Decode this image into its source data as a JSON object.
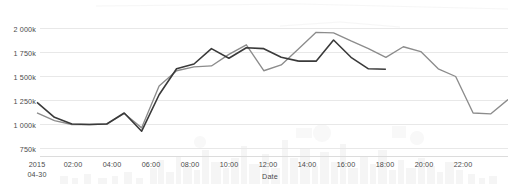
{
  "chart_data": {
    "type": "line",
    "title": "",
    "xlabel": "Date",
    "ylabel": "",
    "ylim": [
      750000,
      2060000
    ],
    "grid": true,
    "legend": "none",
    "y_tick_labels": [
      "2 000k",
      "1 750k",
      "1 500k",
      "1 250k",
      "1 000k",
      "750k"
    ],
    "y_tick_values": [
      2000000,
      1750000,
      1500000,
      1250000,
      1000000,
      750000
    ],
    "x_tick_labels": [
      "2015\n04-30",
      "02:00",
      "04:00",
      "06:00",
      "08:00",
      "10:00",
      "12:00",
      "14:00",
      "16:00",
      "18:00",
      "20:00",
      "22:00"
    ],
    "x_tick_first_line": "2015",
    "x_tick_first_line2": "04-30",
    "x_tick_hours": [
      "02:00",
      "04:00",
      "06:00",
      "08:00",
      "10:00",
      "12:00",
      "14:00",
      "16:00",
      "18:00",
      "20:00",
      "22:00"
    ],
    "x_start_hour": 0,
    "x_end_hour": 23,
    "series": [
      {
        "name": "series-dark",
        "color": "#3a3a3a",
        "x": [
          0,
          1,
          2,
          3,
          4,
          5,
          6,
          7,
          8,
          9,
          10,
          11,
          12,
          13,
          14,
          15
        ],
        "values": [
          1230000,
          1075000,
          1005000,
          1000000,
          1005000,
          1120000,
          930000,
          1310000,
          1580000,
          1630000,
          1790000,
          1690000,
          1800000,
          1790000,
          1700000,
          1660000
        ]
      },
      {
        "name": "series-dark-2",
        "color": "#3a3a3a",
        "x": [
          15,
          16,
          17,
          18,
          19,
          20
        ],
        "values": [
          1660000,
          1660000,
          1880000,
          1700000,
          1580000,
          1575000
        ]
      },
      {
        "name": "series-gray",
        "color": "#8c8c8c",
        "x": [
          0,
          1,
          2,
          3,
          4,
          5,
          6,
          7,
          8,
          9,
          10,
          11,
          12,
          13,
          14,
          15,
          16,
          17,
          18,
          19,
          20,
          21,
          22,
          23,
          24,
          25,
          26,
          27
        ],
        "values": [
          1120000,
          1040000,
          1000000,
          1000000,
          1005000,
          1115000,
          965000,
          1400000,
          1560000,
          1600000,
          1610000,
          1730000,
          1830000,
          1560000,
          1620000,
          1790000,
          1960000,
          1955000,
          1870000,
          1790000,
          1700000,
          1810000,
          1760000,
          1580000,
          1500000,
          1120000,
          1110000,
          1260000
        ]
      }
    ],
    "dark_line_ends_at_hour": 15,
    "annotations": []
  },
  "axis": {
    "x_title": "Date"
  },
  "colors": {
    "grid": "#e8e8e8",
    "axis_text": "#4a4a4a",
    "series_dark": "#3a3a3a",
    "series_gray": "#8c8c8c",
    "background": "#ffffff"
  }
}
